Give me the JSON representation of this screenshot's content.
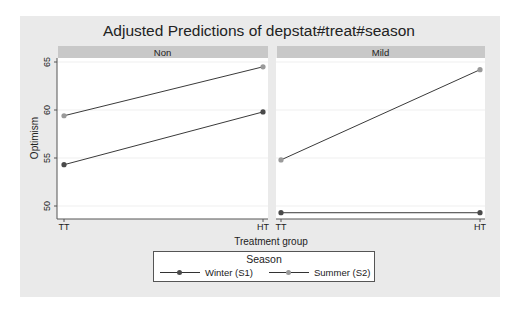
{
  "chart_data": {
    "type": "line",
    "title": "Adjusted Predictions of depstat#treat#season",
    "xlabel": "Treatment group",
    "ylabel": "Optimism",
    "categories": [
      "TT",
      "HT"
    ],
    "yticks": [
      50,
      55,
      60,
      65
    ],
    "ylim": [
      48.5,
      66
    ],
    "grid": true,
    "legend_position": "bottom",
    "legend_title": "Season",
    "panels": [
      {
        "name": "Non",
        "series": [
          {
            "name": "Winter (S1)",
            "values": [
              54.3,
              59.8
            ]
          },
          {
            "name": "Summer (S2)",
            "values": [
              59.4,
              64.5
            ]
          }
        ]
      },
      {
        "name": "Mild",
        "series": [
          {
            "name": "Winter (S1)",
            "values": [
              49.3,
              49.3
            ]
          },
          {
            "name": "Summer (S2)",
            "values": [
              54.8,
              64.2
            ]
          }
        ]
      }
    ]
  },
  "colors": {
    "winter": "#4a4a4a",
    "summer": "#9a9a9a",
    "line": "#3a3a3a",
    "panel_header": "#c8c8c8",
    "outer_bg": "#eaeaea"
  },
  "legend": {
    "title": "Season",
    "items": [
      {
        "label": "Winter (S1)"
      },
      {
        "label": "Summer (S2)"
      }
    ]
  }
}
